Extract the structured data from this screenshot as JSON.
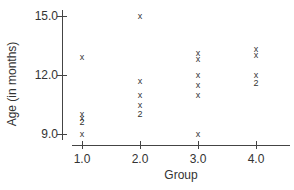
{
  "chart_data": {
    "type": "scatter",
    "title": "",
    "xlabel": "Group",
    "ylabel": "Age (in months)",
    "xlim": [
      0.8,
      4.6
    ],
    "ylim": [
      9.0,
      15.0
    ],
    "x_ticks": [
      "1.0",
      "2.0",
      "3.0",
      "4.0"
    ],
    "y_ticks": [
      "9.0",
      "12.0",
      "15.0"
    ],
    "grid": false,
    "legend": null,
    "marker_note": "'x' = single observation, '2' = two overlapping observations",
    "points": [
      {
        "x": 1,
        "y": 12.9,
        "marker": "x"
      },
      {
        "x": 1,
        "y": 10.0,
        "marker": "x"
      },
      {
        "x": 1,
        "y": 9.8,
        "marker": "x"
      },
      {
        "x": 1,
        "y": 9.6,
        "marker": "2"
      },
      {
        "x": 1,
        "y": 9.0,
        "marker": "x"
      },
      {
        "x": 2,
        "y": 15.0,
        "marker": "x"
      },
      {
        "x": 2,
        "y": 11.7,
        "marker": "x"
      },
      {
        "x": 2,
        "y": 11.0,
        "marker": "x"
      },
      {
        "x": 2,
        "y": 10.5,
        "marker": "x"
      },
      {
        "x": 2,
        "y": 10.0,
        "marker": "2"
      },
      {
        "x": 3,
        "y": 13.1,
        "marker": "x"
      },
      {
        "x": 3,
        "y": 12.8,
        "marker": "x"
      },
      {
        "x": 3,
        "y": 12.0,
        "marker": "x"
      },
      {
        "x": 3,
        "y": 11.5,
        "marker": "x"
      },
      {
        "x": 3,
        "y": 11.0,
        "marker": "x"
      },
      {
        "x": 3,
        "y": 9.0,
        "marker": "x"
      },
      {
        "x": 4,
        "y": 13.3,
        "marker": "x"
      },
      {
        "x": 4,
        "y": 13.0,
        "marker": "x"
      },
      {
        "x": 4,
        "y": 12.0,
        "marker": "x"
      },
      {
        "x": 4,
        "y": 11.6,
        "marker": "2"
      }
    ]
  }
}
